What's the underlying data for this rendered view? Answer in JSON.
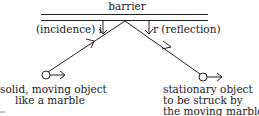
{
  "diagram": {
    "barrier_label": "barrier",
    "incidence_label": "(incidence) i",
    "reflection_label": "r (reflection)",
    "moving_object": {
      "lines": [
        "solid, moving object",
        "like a marble"
      ]
    },
    "stationary_object": {
      "lines": [
        "stationary object",
        "to be struck by",
        "the moving marble"
      ]
    },
    "colors": {
      "ink": "#222222",
      "background": "#ffffff"
    }
  }
}
